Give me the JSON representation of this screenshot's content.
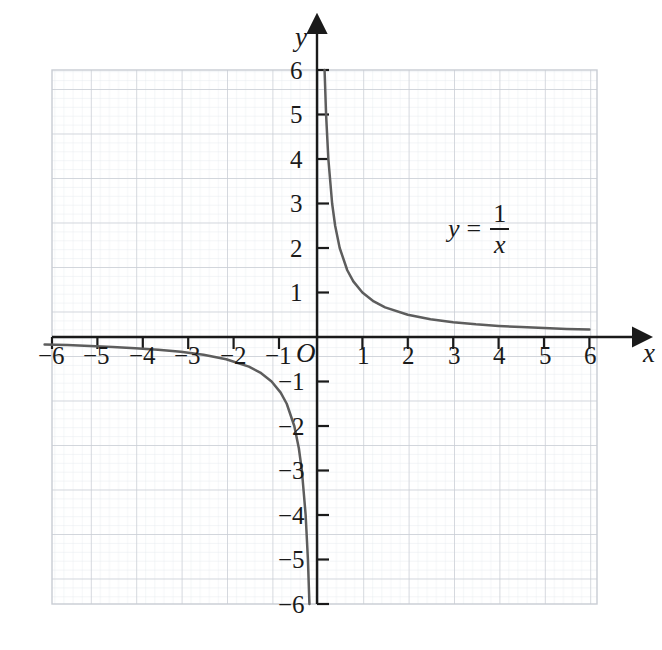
{
  "chart_data": {
    "type": "line",
    "title": "",
    "equation_label": {
      "lhs": "y",
      "relation": "=",
      "numerator": "1",
      "denominator": "x"
    },
    "function": "y = 1/x",
    "xlabel": "x",
    "ylabel": "y",
    "origin_label": "O",
    "xlim": [
      -6,
      6
    ],
    "ylim": [
      -6,
      6
    ],
    "grid": true,
    "grid_major_step": 1,
    "grid_minor_step": 0.2,
    "legend": "none",
    "x_ticks": [
      "−6",
      "−5",
      "−4",
      "−3",
      "−2",
      "−1",
      "1",
      "2",
      "3",
      "4",
      "5",
      "6"
    ],
    "x_tick_values": [
      -6,
      -5,
      -4,
      -3,
      -2,
      -1,
      1,
      2,
      3,
      4,
      5,
      6
    ],
    "y_ticks": [
      "6",
      "5",
      "4",
      "3",
      "2",
      "1",
      "−1",
      "−2",
      "−3",
      "−4",
      "−5",
      "−6"
    ],
    "y_tick_values": [
      6,
      5,
      4,
      3,
      2,
      1,
      -1,
      -2,
      -3,
      -4,
      -5,
      -6
    ],
    "series": [
      {
        "name": "y = 1/x (positive branch)",
        "x": [
          0.1667,
          0.2,
          0.25,
          0.3333,
          0.4,
          0.5,
          0.6667,
          0.8,
          1,
          1.25,
          1.5,
          2,
          2.5,
          3,
          3.5,
          4,
          4.5,
          5,
          5.5,
          6
        ],
        "y": [
          6,
          5,
          4,
          3,
          2.5,
          2,
          1.5,
          1.25,
          1,
          0.8,
          0.6667,
          0.5,
          0.4,
          0.3333,
          0.2857,
          0.25,
          0.2222,
          0.2,
          0.1818,
          0.1667
        ]
      },
      {
        "name": "y = 1/x (negative branch)",
        "x": [
          -6,
          -5.5,
          -5,
          -4.5,
          -4,
          -3.5,
          -3,
          -2.5,
          -2,
          -1.5,
          -1.25,
          -1,
          -0.8,
          -0.6667,
          -0.5,
          -0.4,
          -0.3333,
          -0.25,
          -0.2,
          -0.1667
        ],
        "y": [
          -0.1667,
          -0.1818,
          -0.2,
          -0.2222,
          -0.25,
          -0.2857,
          -0.3333,
          -0.4,
          -0.5,
          -0.6667,
          -0.8,
          -1,
          -1.25,
          -1.5,
          -2,
          -2.5,
          -3,
          -4,
          -5,
          -6
        ]
      }
    ],
    "colors": {
      "curve": "#5d5d5d",
      "axis": "#1a1a1a",
      "grid_major": "#c9cdd4",
      "grid_minor": "#e4e7ec",
      "background": "#ffffff"
    }
  }
}
